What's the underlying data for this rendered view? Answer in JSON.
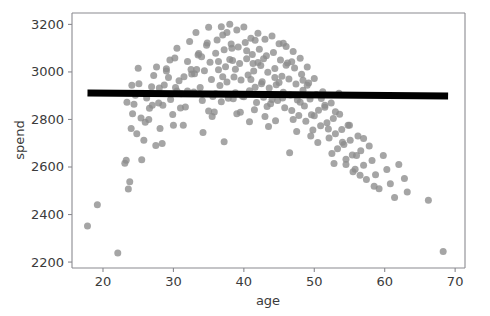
{
  "chart_data": {
    "type": "scatter",
    "title": "",
    "xlabel": "age",
    "ylabel": "spend",
    "xlim": [
      15.6,
      71.4
    ],
    "ylim": [
      2175,
      3248
    ],
    "xticks": [
      20,
      30,
      40,
      50,
      60,
      70
    ],
    "yticks": [
      2200,
      2400,
      2600,
      2800,
      3000,
      3200
    ],
    "xtick_labels": [
      "20",
      "30",
      "40",
      "50",
      "60",
      "70"
    ],
    "ytick_labels": [
      "2200",
      "2400",
      "2600",
      "2800",
      "3000",
      "3200"
    ],
    "grid": false,
    "legend": null,
    "point_color": "#8c8c8c",
    "point_opacity": 0.78,
    "point_size": 7,
    "series": [
      {
        "name": "spend vs age",
        "marker": "circle",
        "x": [
          17.8,
          19.2,
          22.1,
          23.1,
          23.3,
          23.6,
          23.8,
          24.0,
          24.2,
          24.4,
          24.6,
          25.1,
          25.4,
          25.8,
          26.2,
          26.6,
          26.9,
          27.2,
          27.6,
          27.9,
          28.1,
          28.4,
          28.7,
          29.0,
          29.3,
          29.6,
          29.9,
          30.2,
          30.5,
          30.8,
          31.1,
          31.4,
          31.7,
          32.0,
          32.3,
          32.6,
          32.9,
          33.2,
          33.5,
          33.8,
          34.1,
          34.4,
          34.7,
          35.0,
          35.2,
          35.4,
          35.6,
          35.8,
          36.0,
          36.2,
          36.4,
          36.6,
          36.8,
          37.0,
          37.2,
          37.4,
          37.6,
          37.8,
          38.0,
          38.2,
          38.4,
          38.6,
          38.8,
          39.0,
          39.2,
          39.4,
          39.6,
          39.8,
          40.0,
          40.2,
          40.4,
          40.6,
          40.8,
          41.0,
          41.2,
          41.4,
          41.6,
          41.8,
          42.0,
          42.2,
          42.4,
          42.6,
          42.8,
          43.0,
          43.2,
          43.4,
          43.6,
          43.8,
          44.0,
          44.2,
          44.4,
          44.6,
          44.8,
          45.0,
          45.2,
          45.4,
          45.6,
          45.8,
          46.0,
          46.2,
          46.4,
          46.6,
          46.8,
          47.0,
          47.2,
          47.4,
          47.6,
          47.8,
          48.0,
          48.2,
          48.4,
          48.6,
          48.8,
          49.0,
          49.2,
          49.4,
          49.6,
          49.8,
          50.0,
          50.3,
          50.6,
          50.9,
          51.2,
          51.5,
          51.8,
          52.1,
          52.4,
          52.7,
          53.0,
          53.3,
          53.6,
          53.9,
          54.2,
          54.5,
          54.8,
          55.1,
          55.4,
          55.8,
          56.2,
          56.6,
          57.0,
          57.4,
          57.8,
          58.2,
          58.7,
          59.2,
          59.8,
          60.3,
          60.8,
          61.4,
          62.0,
          62.8,
          63.2,
          66.2,
          68.3,
          23.4,
          24.1,
          25.0,
          26.0,
          27.0,
          28.0,
          29.0,
          30.0,
          31.0,
          32.0,
          33.0,
          34.0,
          35.0,
          36.0,
          37.0,
          38.0,
          39.0,
          40.0,
          41.0,
          42.0,
          43.0,
          44.0,
          45.0,
          46.0,
          47.0,
          48.0,
          49.0,
          50.0,
          51.0,
          52.0,
          53.0,
          54.0,
          55.0,
          56.0,
          57.0,
          33.6,
          34.8,
          36.4,
          37.6,
          38.8,
          40.4,
          41.6,
          42.8,
          44.4,
          45.6,
          46.8,
          48.4,
          35.5,
          38.5,
          41.5,
          44.5,
          47.5,
          30.5,
          32.5,
          50.5,
          52.5,
          28.5,
          26.5,
          54.5,
          56.5,
          24.8,
          58.5,
          43.5,
          39.5,
          36.8,
          31.5,
          29.5,
          49.5,
          45.5,
          42.5,
          34.2,
          37.2,
          40.8,
          46.5,
          52.8,
          27.5,
          25.5,
          51.5,
          53.5,
          55.5,
          33.3,
          30.3,
          43.3,
          38.3,
          41.3
        ],
        "y": [
          2352,
          2441,
          2238,
          2616,
          2628,
          2507,
          2538,
          2762,
          2824,
          2864,
          2902,
          2950,
          2806,
          2713,
          2890,
          2847,
          2938,
          2985,
          3021,
          2869,
          2762,
          2699,
          2945,
          3013,
          2977,
          2884,
          2821,
          3059,
          3100,
          2963,
          2908,
          2776,
          2852,
          3044,
          3128,
          2991,
          2916,
          3166,
          3071,
          2935,
          2880,
          3005,
          3112,
          3188,
          3041,
          2968,
          2897,
          2831,
          3079,
          3134,
          3009,
          2943,
          2875,
          3155,
          3093,
          3022,
          2958,
          2889,
          3201,
          3118,
          3048,
          2979,
          2912,
          3176,
          3105,
          3035,
          2966,
          2898,
          3189,
          3124,
          3056,
          2987,
          2921,
          3142,
          3073,
          3004,
          2936,
          2871,
          3163,
          3095,
          3027,
          2959,
          2893,
          3138,
          3068,
          2999,
          2932,
          2866,
          3151,
          3082,
          3014,
          2946,
          2880,
          3119,
          3050,
          2982,
          2915,
          2849,
          3107,
          3038,
          2970,
          2903,
          2838,
          3086,
          3017,
          2949,
          2882,
          2817,
          3058,
          2990,
          2923,
          2857,
          2792,
          3021,
          2953,
          2886,
          2820,
          2756,
          2972,
          2905,
          2839,
          2774,
          2917,
          2851,
          2786,
          2722,
          2869,
          2804,
          2740,
          2677,
          2822,
          2758,
          2695,
          2633,
          2776,
          2713,
          2651,
          2590,
          2730,
          2668,
          2607,
          2547,
          2688,
          2627,
          2567,
          2508,
          2648,
          2589,
          2530,
          2472,
          2610,
          2552,
          2495,
          2460,
          2244,
          2872,
          2944,
          3016,
          2788,
          2860,
          2932,
          3004,
          2776,
          2848,
          2920,
          2992,
          3064,
          2836,
          2908,
          2980,
          3052,
          2824,
          2896,
          2968,
          3040,
          2812,
          2884,
          2956,
          3028,
          2800,
          2872,
          2944,
          2816,
          2888,
          2760,
          2832,
          2704,
          2776,
          2648,
          2720,
          3078,
          3122,
          3044,
          3166,
          3011,
          3089,
          3133,
          3055,
          2977,
          3121,
          3043,
          2965,
          2813,
          2887,
          2841,
          2795,
          2749,
          2920,
          3010,
          2703,
          2657,
          2860,
          2800,
          2611,
          2565,
          2740,
          2519,
          2770,
          2830,
          3190,
          2980,
          3050,
          2730,
          2890,
          2950,
          2745,
          2706,
          2790,
          2660,
          2615,
          2690,
          2630,
          2860,
          2910,
          2580,
          3010,
          2935,
          2855,
          3100,
          3035
        ],
        "color": "#8c8c8c"
      }
    ],
    "fit_line": {
      "name": "linear fit",
      "color": "#000000",
      "linewidth": 7,
      "x_start": 17.8,
      "x_end": 69.0,
      "y_start": 2911,
      "y_end": 2899
    }
  }
}
